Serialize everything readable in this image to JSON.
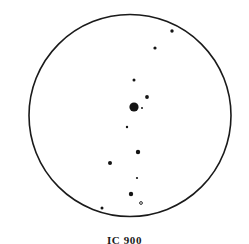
{
  "figure": {
    "title": "",
    "caption": "IC 900",
    "caption_x": 0,
    "caption_y": 234,
    "background_color": "#ffffff",
    "ink_color": "#1a1a1a"
  },
  "field_circle": {
    "label": "field-of-view-circle",
    "center_x": 130,
    "center_y": 115.5,
    "radius": 101,
    "stroke_color": "#1a1a1a",
    "stroke_width": 1.6,
    "fill": "none"
  },
  "chart_data": {
    "type": "scatter",
    "title": "IC 900",
    "subtitle": "",
    "xlabel": "",
    "ylabel": "",
    "xlim": [
      29,
      231
    ],
    "ylim": [
      14.5,
      216.5
    ],
    "grid": false,
    "legend": null,
    "marker_color": "#141414",
    "points": [
      {
        "id": "star-1",
        "x": 172,
        "y": 31,
        "r": 1.7,
        "style": "filled"
      },
      {
        "id": "star-2",
        "x": 155,
        "y": 48,
        "r": 1.6,
        "style": "filled"
      },
      {
        "id": "star-3",
        "x": 134,
        "y": 80,
        "r": 1.5,
        "style": "filled"
      },
      {
        "id": "star-4",
        "x": 147,
        "y": 97,
        "r": 1.9,
        "style": "filled"
      },
      {
        "id": "star-5",
        "x": 134,
        "y": 107,
        "r": 4.6,
        "style": "filled"
      },
      {
        "id": "star-6",
        "x": 142,
        "y": 108,
        "r": 1.0,
        "style": "filled"
      },
      {
        "id": "star-7",
        "x": 127,
        "y": 127,
        "r": 1.2,
        "style": "filled"
      },
      {
        "id": "star-8",
        "x": 138,
        "y": 152,
        "r": 2.2,
        "style": "filled"
      },
      {
        "id": "star-9",
        "x": 110,
        "y": 163,
        "r": 2.0,
        "style": "filled"
      },
      {
        "id": "star-10",
        "x": 137,
        "y": 178,
        "r": 1.1,
        "style": "filled"
      },
      {
        "id": "star-11",
        "x": 131,
        "y": 194,
        "r": 2.2,
        "style": "filled"
      },
      {
        "id": "star-12",
        "x": 141,
        "y": 203,
        "r": 1.4,
        "style": "open"
      },
      {
        "id": "star-13",
        "x": 102,
        "y": 208,
        "r": 1.5,
        "style": "filled"
      }
    ]
  }
}
